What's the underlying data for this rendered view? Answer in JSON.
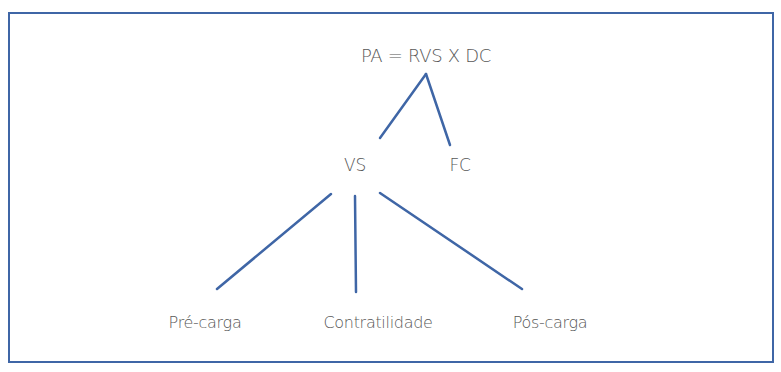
{
  "diagram": {
    "formula": "PA = RVS X DC",
    "level2": [
      {
        "id": "vs",
        "label": "VS"
      },
      {
        "id": "fc",
        "label": "FC"
      }
    ],
    "level3": [
      {
        "id": "pre-carga",
        "label": "Pré-carga"
      },
      {
        "id": "contratilidade",
        "label": "Contratilidade"
      },
      {
        "id": "pos-carga",
        "label": "Pós-carga"
      }
    ],
    "colors": {
      "line": "#3f66a6",
      "border": "#3f66a6",
      "text": "#575757",
      "background": "#ffffff"
    }
  }
}
